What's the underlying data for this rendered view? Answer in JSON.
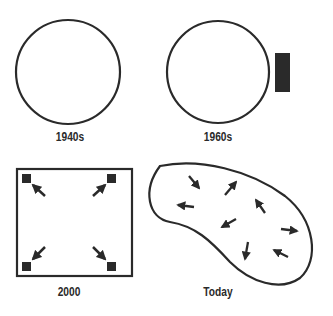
{
  "panels": [
    {
      "id": "1940s",
      "label": "1940s",
      "shape": "circle"
    },
    {
      "id": "1960s",
      "label": "1960s",
      "shape": "circle-with-external-block"
    },
    {
      "id": "2000",
      "label": "2000",
      "shape": "square-with-corner-blocks-and-outward-arrows"
    },
    {
      "id": "today",
      "label": "Today",
      "shape": "amorphous-blob-with-scattered-arrows"
    }
  ],
  "colors": {
    "stroke": "#2a2a2a",
    "fill": "#2a2a2a",
    "background": "#ffffff"
  }
}
